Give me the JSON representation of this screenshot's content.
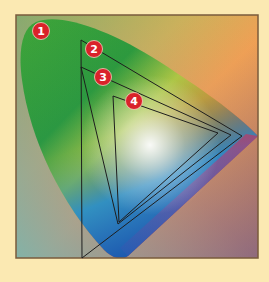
{
  "diagram": {
    "background_color": "#fbe9b2",
    "frame": {
      "x": 16,
      "y": 15,
      "width": 242,
      "height": 243,
      "border_color": "#7a5b3c"
    },
    "badge_color": "#d9222a",
    "outline_color": "#1e1e1e",
    "labels": [
      {
        "id": "1",
        "text": "1",
        "cx": 41,
        "cy": 31,
        "refers_to": "visible-spectrum-horseshoe"
      },
      {
        "id": "2",
        "text": "2",
        "cx": 94,
        "cy": 49,
        "refers_to": "gamut-triangle-large"
      },
      {
        "id": "3",
        "text": "3",
        "cx": 103,
        "cy": 77,
        "refers_to": "gamut-triangle-medium"
      },
      {
        "id": "4",
        "text": "4",
        "cx": 134,
        "cy": 101,
        "refers_to": "gamut-triangle-small"
      }
    ],
    "gamuts": [
      {
        "id": "2",
        "points": "81,40 242,136 82,258"
      },
      {
        "id": "3",
        "points": "81,67 231,135 118,224"
      },
      {
        "id": "4",
        "points": "113,96 218,133 119,222"
      }
    ]
  }
}
